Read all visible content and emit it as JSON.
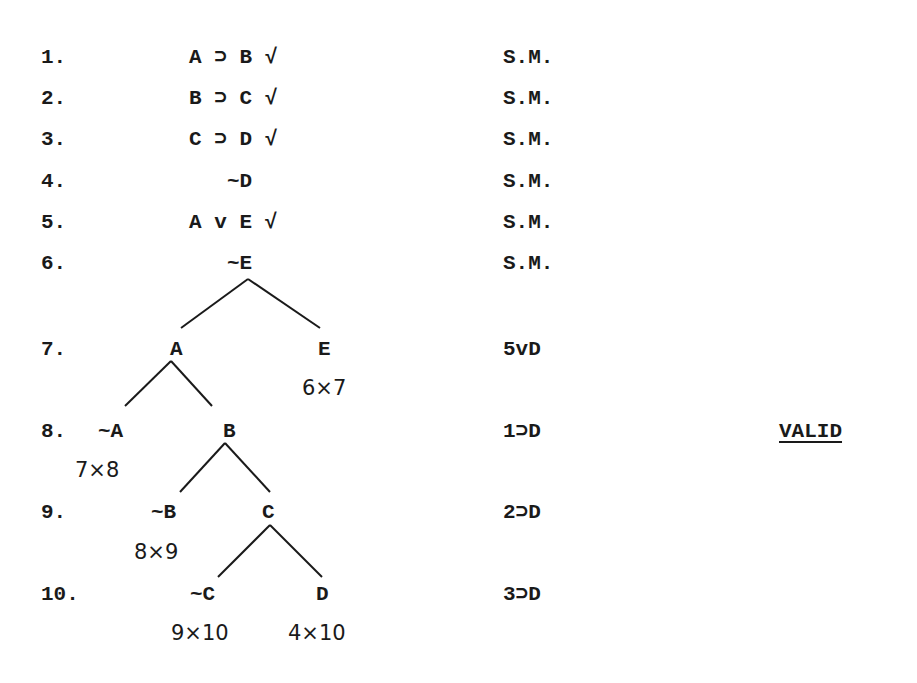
{
  "proof": {
    "lines": [
      {
        "num": "1.",
        "formula": "A ⊃ B √",
        "just": "S.M."
      },
      {
        "num": "2.",
        "formula": "B ⊃ C √",
        "just": "S.M."
      },
      {
        "num": "3.",
        "formula": "C ⊃ D √",
        "just": "S.M."
      },
      {
        "num": "4.",
        "formula": "~D",
        "just": "S.M."
      },
      {
        "num": "5.",
        "formula": "A v E √",
        "just": "S.M."
      },
      {
        "num": "6.",
        "formula": "~E",
        "just": "S.M."
      },
      {
        "num": "7.",
        "left": "A",
        "right": "E",
        "just": "5vD"
      },
      {
        "num": "8.",
        "left": "~A",
        "right": "B",
        "just": "1⊃D"
      },
      {
        "num": "9.",
        "left": "~B",
        "right": "C",
        "just": "2⊃D"
      },
      {
        "num": "10.",
        "left": "~C",
        "right": "D",
        "just": "3⊃D"
      }
    ],
    "closures": {
      "e": "6×7",
      "not_a": "7×8",
      "not_b": "8×9",
      "not_c": "9×10",
      "d": "4×10"
    },
    "verdict": "VALID"
  }
}
